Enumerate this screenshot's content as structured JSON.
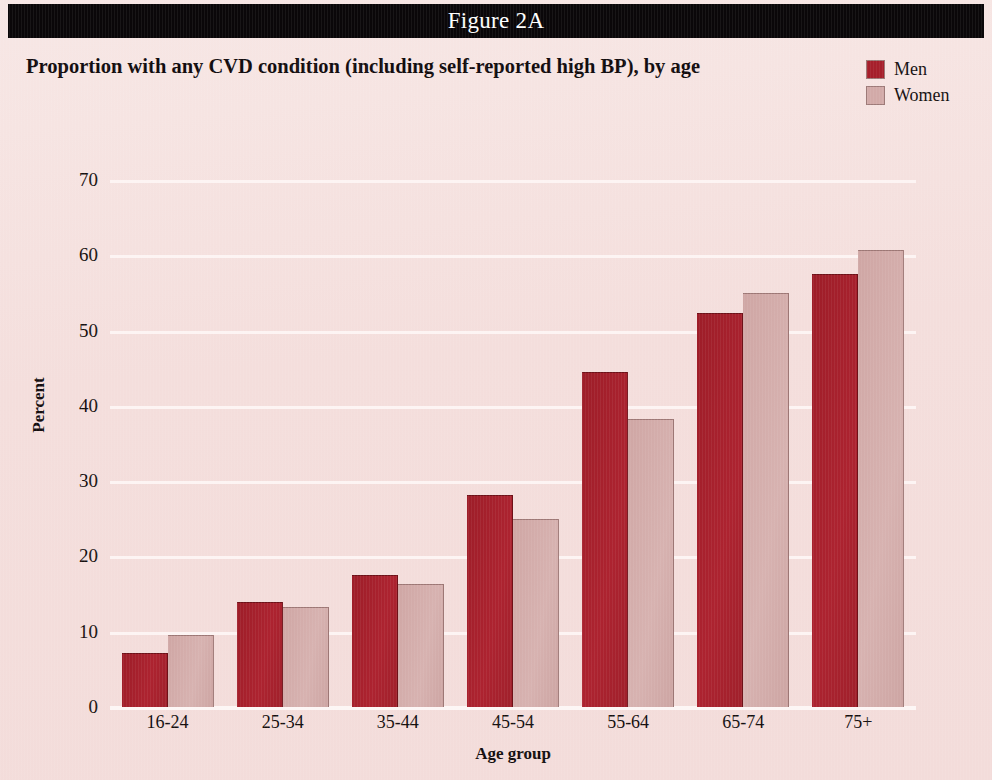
{
  "banner": {
    "label": "Figure 2A"
  },
  "chart_title": "Proportion with any CVD condition (including self-reported high BP), by age",
  "legend": {
    "position": "top-right",
    "entries": [
      {
        "label": "Men",
        "color": "#a61f2b"
      },
      {
        "label": "Women",
        "color": "#d2aaa8"
      }
    ]
  },
  "axes": {
    "y_title": "Percent",
    "x_title": "Age group",
    "y_ticks": [
      0,
      10,
      20,
      30,
      40,
      50,
      60,
      70
    ]
  },
  "chart_data": {
    "type": "bar",
    "title": "Proportion with any CVD condition (including self-reported high BP), by age",
    "subtitle": "Figure 2A",
    "xlabel": "Age group",
    "ylabel": "Percent",
    "ylim": [
      0,
      70
    ],
    "ytick_step": 10,
    "grid": true,
    "grid_axis": "y",
    "legend": "top-right",
    "categories": [
      "16-24",
      "25-34",
      "35-44",
      "45-54",
      "55-64",
      "65-74",
      "75+"
    ],
    "series": [
      {
        "name": "Men",
        "color": "#a61f2b",
        "values": [
          7.0,
          13.8,
          17.4,
          28.0,
          44.4,
          52.2,
          57.4
        ]
      },
      {
        "name": "Women",
        "color": "#d2aaa8",
        "values": [
          9.4,
          13.2,
          16.2,
          24.9,
          38.1,
          54.8,
          60.6
        ]
      }
    ]
  }
}
